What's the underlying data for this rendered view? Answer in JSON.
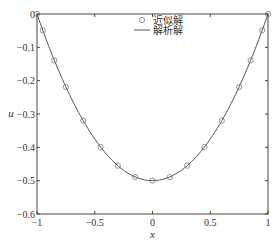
{
  "chart_data": {
    "type": "line",
    "title": "",
    "xlabel": "x",
    "ylabel": "u",
    "xlim": [
      -1,
      1
    ],
    "ylim": [
      -0.6,
      0
    ],
    "xticks": [
      -1,
      -0.5,
      0,
      0.5,
      1
    ],
    "xtick_labels": [
      "−1",
      "−0.5",
      "0",
      "0.5",
      "1"
    ],
    "yticks": [
      0,
      -0.1,
      -0.2,
      -0.3,
      -0.4,
      -0.5,
      -0.6
    ],
    "ytick_labels": [
      "0",
      "−0.1",
      "−0.2",
      "−0.3",
      "−0.4",
      "−0.5",
      "−0.6"
    ],
    "grid": false,
    "legend_position": "upper center",
    "series": [
      {
        "name": "近似解",
        "style": "circle-markers",
        "x": [
          -1,
          -0.95,
          -0.85,
          -0.75,
          -0.6,
          -0.45,
          -0.3,
          -0.15,
          0,
          0.15,
          0.3,
          0.45,
          0.6,
          0.75,
          0.85,
          0.95,
          1
        ],
        "values": [
          0,
          -0.049,
          -0.139,
          -0.219,
          -0.32,
          -0.399,
          -0.455,
          -0.489,
          -0.5,
          -0.489,
          -0.455,
          -0.399,
          -0.32,
          -0.219,
          -0.139,
          -0.049,
          0
        ]
      },
      {
        "name": "解析解",
        "style": "solid-line",
        "formula": "u = (x^2 - 1) / 2",
        "x": [
          -1,
          -0.75,
          -0.5,
          -0.25,
          0,
          0.25,
          0.5,
          0.75,
          1
        ],
        "values": [
          0,
          -0.219,
          -0.375,
          -0.469,
          -0.5,
          -0.469,
          -0.375,
          -0.219,
          0
        ]
      }
    ]
  },
  "legend": {
    "items": [
      {
        "label": "近似解",
        "symbol": "circle"
      },
      {
        "label": "解析解",
        "symbol": "line"
      }
    ]
  },
  "axes": {
    "xlabel": "x",
    "ylabel": "u"
  },
  "colors": {
    "line": "#555555",
    "marker": "#777777",
    "axis": "#444444"
  }
}
